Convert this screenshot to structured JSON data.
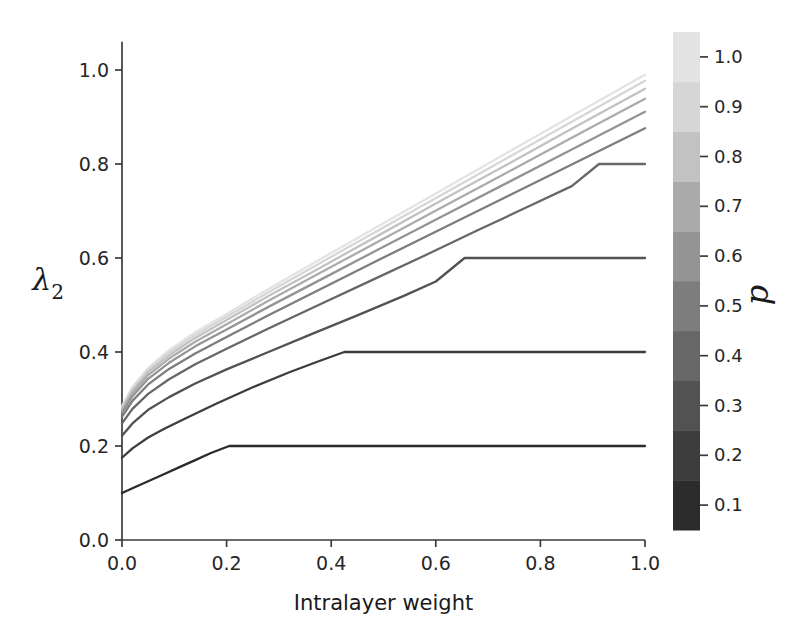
{
  "chart_data": {
    "type": "line",
    "title": "",
    "xlabel": "Intralayer weight",
    "ylabel": "λ₂",
    "xlim": [
      0.0,
      1.0
    ],
    "ylim": [
      0.0,
      1.06
    ],
    "grid": false,
    "xticks": [
      0.0,
      0.2,
      0.4,
      0.6,
      0.8,
      1.0
    ],
    "xticklabels": [
      "0.0",
      "0.2",
      "0.4",
      "0.6",
      "0.8",
      "1.0"
    ],
    "yticks": [
      0.0,
      0.2,
      0.4,
      0.6,
      0.8,
      1.0
    ],
    "yticklabels": [
      "0.0",
      "0.2",
      "0.4",
      "0.6",
      "0.8",
      "1.0"
    ],
    "colorbar": {
      "label": "p",
      "position": "right",
      "discrete": true,
      "ticks": [
        0.1,
        0.2,
        0.3,
        0.4,
        0.5,
        0.6,
        0.7,
        0.8,
        0.9,
        1.0
      ],
      "ticklabels": [
        "0.1",
        "0.2",
        "0.3",
        "0.4",
        "0.5",
        "0.6",
        "0.7",
        "0.8",
        "0.9",
        "1.0"
      ],
      "vmin": 0.05,
      "vmax": 1.05,
      "colors": [
        "#2b2b2b",
        "#3d3d3d",
        "#525252",
        "#676767",
        "#7d7d7d",
        "#949494",
        "#ababab",
        "#c2c2c2",
        "#d6d6d6",
        "#e3e3e3"
      ]
    },
    "series": [
      {
        "name": "p = 0.1",
        "p": 0.1,
        "color": "#2b2b2b",
        "plateau_y": 0.2,
        "plateau_x": 0.205,
        "x": [
          0.0,
          0.02,
          0.05,
          0.08,
          0.11,
          0.14,
          0.17,
          0.205,
          0.3,
          0.5,
          0.7,
          0.85,
          1.0
        ],
        "y": [
          0.1,
          0.11,
          0.125,
          0.14,
          0.155,
          0.17,
          0.185,
          0.2,
          0.2,
          0.2,
          0.2,
          0.2,
          0.2
        ]
      },
      {
        "name": "p = 0.2",
        "p": 0.2,
        "color": "#3d3d3d",
        "plateau_y": 0.4,
        "plateau_x": 0.425,
        "x": [
          0.0,
          0.02,
          0.05,
          0.08,
          0.12,
          0.18,
          0.25,
          0.32,
          0.38,
          0.425,
          0.55,
          0.7,
          0.85,
          1.0
        ],
        "y": [
          0.175,
          0.195,
          0.218,
          0.236,
          0.258,
          0.29,
          0.325,
          0.357,
          0.382,
          0.4,
          0.4,
          0.4,
          0.4,
          0.4
        ]
      },
      {
        "name": "p = 0.3",
        "p": 0.3,
        "color": "#525252",
        "plateau_y": 0.6,
        "plateau_x": 0.655,
        "x": [
          0.0,
          0.02,
          0.05,
          0.09,
          0.14,
          0.2,
          0.28,
          0.36,
          0.45,
          0.54,
          0.6,
          0.655,
          0.78,
          0.9,
          1.0
        ],
        "y": [
          0.222,
          0.248,
          0.277,
          0.304,
          0.333,
          0.363,
          0.4,
          0.437,
          0.478,
          0.52,
          0.55,
          0.6,
          0.6,
          0.6,
          0.6
        ]
      },
      {
        "name": "p = 0.4",
        "p": 0.4,
        "color": "#676767",
        "plateau_y": 0.8,
        "plateau_x": 0.912,
        "x": [
          0.0,
          0.02,
          0.05,
          0.09,
          0.14,
          0.2,
          0.28,
          0.38,
          0.48,
          0.58,
          0.68,
          0.78,
          0.86,
          0.912,
          0.96,
          1.0
        ],
        "y": [
          0.248,
          0.279,
          0.311,
          0.342,
          0.374,
          0.407,
          0.45,
          0.502,
          0.554,
          0.606,
          0.659,
          0.711,
          0.753,
          0.8,
          0.8,
          0.8
        ]
      },
      {
        "name": "p = 0.5",
        "p": 0.5,
        "color": "#7d7d7d",
        "plateau_y": null,
        "plateau_x": null,
        "x": [
          0.0,
          0.02,
          0.05,
          0.09,
          0.14,
          0.2,
          0.28,
          0.38,
          0.5,
          0.62,
          0.74,
          0.86,
          1.0
        ],
        "y": [
          0.262,
          0.296,
          0.331,
          0.364,
          0.397,
          0.432,
          0.478,
          0.534,
          0.601,
          0.667,
          0.733,
          0.799,
          0.876
        ]
      },
      {
        "name": "p = 0.6",
        "p": 0.6,
        "color": "#949494",
        "plateau_y": null,
        "plateau_x": null,
        "x": [
          0.0,
          0.02,
          0.05,
          0.09,
          0.14,
          0.2,
          0.28,
          0.38,
          0.5,
          0.62,
          0.74,
          0.86,
          1.0
        ],
        "y": [
          0.27,
          0.306,
          0.343,
          0.377,
          0.412,
          0.448,
          0.496,
          0.554,
          0.624,
          0.693,
          0.762,
          0.831,
          0.911
        ]
      },
      {
        "name": "p = 0.7",
        "p": 0.7,
        "color": "#ababab",
        "plateau_y": null,
        "plateau_x": null,
        "x": [
          0.0,
          0.02,
          0.05,
          0.09,
          0.14,
          0.2,
          0.28,
          0.38,
          0.5,
          0.62,
          0.74,
          0.86,
          1.0
        ],
        "y": [
          0.275,
          0.313,
          0.351,
          0.386,
          0.422,
          0.459,
          0.509,
          0.569,
          0.641,
          0.713,
          0.784,
          0.856,
          0.939
        ]
      },
      {
        "name": "p = 0.8",
        "p": 0.8,
        "color": "#c2c2c2",
        "plateau_y": null,
        "plateau_x": null,
        "x": [
          0.0,
          0.02,
          0.05,
          0.09,
          0.14,
          0.2,
          0.28,
          0.38,
          0.5,
          0.62,
          0.74,
          0.86,
          1.0
        ],
        "y": [
          0.279,
          0.318,
          0.357,
          0.393,
          0.43,
          0.468,
          0.519,
          0.58,
          0.654,
          0.728,
          0.801,
          0.875,
          0.96
        ]
      },
      {
        "name": "p = 0.9",
        "p": 0.9,
        "color": "#d6d6d6",
        "plateau_y": null,
        "plateau_x": null,
        "x": [
          0.0,
          0.02,
          0.05,
          0.09,
          0.14,
          0.2,
          0.28,
          0.38,
          0.5,
          0.62,
          0.74,
          0.86,
          1.0
        ],
        "y": [
          0.282,
          0.322,
          0.362,
          0.399,
          0.436,
          0.475,
          0.527,
          0.59,
          0.665,
          0.74,
          0.815,
          0.89,
          0.977
        ]
      },
      {
        "name": "p = 1.0",
        "p": 1.0,
        "color": "#e3e3e3",
        "plateau_y": null,
        "plateau_x": null,
        "x": [
          0.0,
          0.02,
          0.05,
          0.09,
          0.14,
          0.2,
          0.28,
          0.38,
          0.5,
          0.62,
          0.74,
          0.86,
          1.0
        ],
        "y": [
          0.285,
          0.326,
          0.366,
          0.404,
          0.442,
          0.481,
          0.534,
          0.598,
          0.674,
          0.75,
          0.826,
          0.902,
          0.99
        ]
      }
    ]
  },
  "axes": {
    "x_label": "Intralayer weight",
    "y_label": "λ",
    "y_label_sub": "2"
  },
  "colorbar_label": "p"
}
